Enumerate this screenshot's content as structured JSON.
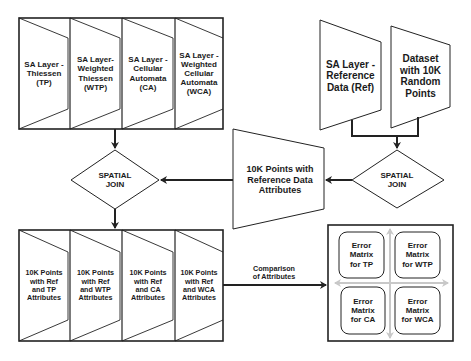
{
  "diagram": {
    "top_layers": [
      {
        "label": "SA Layer -\nThiessen\n(TP)"
      },
      {
        "label": "SA Layer-\nWeighted\nThiessen\n(WTP)"
      },
      {
        "label": "SA Layer -\nCellular\nAutomata\n(CA)"
      },
      {
        "label": "SA Layer -\nWeighted\nCellular\nAutomata\n(WCA)"
      }
    ],
    "reference_layer": {
      "label": "SA Layer -\nReference\nData (Ref)"
    },
    "random_dataset": {
      "label": "Dataset\nwith 10K\nRandom\nPoints"
    },
    "spatial_join_right": {
      "label": "SPATIAL\nJOIN"
    },
    "spatial_join_left": {
      "label": "SPATIAL\nJOIN"
    },
    "reference_points": {
      "label": "10K Points with\nReference Data\nAttributes"
    },
    "bottom_layers": [
      {
        "label": "10K Points\nwith Ref\nand TP\nAttributes"
      },
      {
        "label": "10K Points\nwith Ref\nand WTP\nAttributes"
      },
      {
        "label": "10K Points\nwith Ref\nand CA\nAttributes"
      },
      {
        "label": "10K Points\nwith Ref\nand WCA\nAttributes"
      }
    ],
    "comparison_label": "Comparison\nof Attributes",
    "error_matrices": [
      {
        "label": "Error\nMatrix\nfor TP"
      },
      {
        "label": "Error\nMatrix\nfor WTP"
      },
      {
        "label": "Error\nMatrix\nfor CA"
      },
      {
        "label": "Error\nMatrix\nfor WCA"
      }
    ],
    "colors": {
      "stroke": "#222222",
      "cross_arrow": "#c8c8c8",
      "text": "#1a1a1a"
    }
  }
}
